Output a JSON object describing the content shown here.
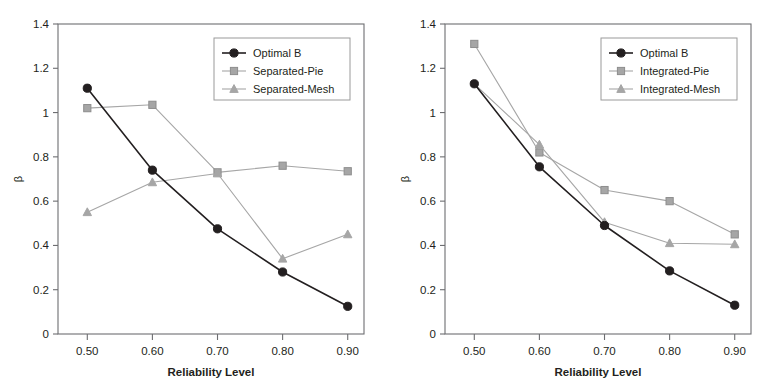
{
  "figure": {
    "background": "#ffffff",
    "panel_count": 2
  },
  "chart_data": [
    {
      "type": "line",
      "panel": "left",
      "title": "",
      "xlabel": "Reliability Level",
      "ylabel": "β",
      "x": [
        0.5,
        0.6,
        0.7,
        0.8,
        0.9
      ],
      "xticklabels": [
        "0.50",
        "0.60",
        "0.70",
        "0.80",
        "0.90"
      ],
      "yticklabels": [
        "0",
        "0.2",
        "0.4",
        "0.6",
        "0.8",
        "1",
        "1.2",
        "1.4"
      ],
      "yticks": [
        0,
        0.2,
        0.4,
        0.6,
        0.8,
        1.0,
        1.2,
        1.4
      ],
      "xlim": [
        0.455,
        0.925
      ],
      "ylim": [
        0,
        1.4
      ],
      "grid": false,
      "legend_position": "upper-right",
      "series": [
        {
          "name": "Optimal B",
          "values": [
            1.11,
            0.74,
            0.475,
            0.28,
            0.125
          ],
          "color": "#231f20",
          "marker": "circle",
          "linewidth": 1.6
        },
        {
          "name": "Separated-Pie",
          "values": [
            1.02,
            1.035,
            0.73,
            0.76,
            0.735
          ],
          "color": "#a6a6a6",
          "marker": "square",
          "linewidth": 1.1
        },
        {
          "name": "Separated-Mesh",
          "values": [
            0.55,
            0.685,
            0.725,
            0.34,
            0.45
          ],
          "color": "#a6a6a6",
          "marker": "triangle",
          "linewidth": 1.1
        }
      ]
    },
    {
      "type": "line",
      "panel": "right",
      "title": "",
      "xlabel": "Reliability Level",
      "ylabel": "β",
      "x": [
        0.5,
        0.6,
        0.7,
        0.8,
        0.9
      ],
      "xticklabels": [
        "0.50",
        "0.60",
        "0.70",
        "0.80",
        "0.90"
      ],
      "yticklabels": [
        "0",
        "0.2",
        "0.4",
        "0.6",
        "0.8",
        "1",
        "1.2",
        "1.4"
      ],
      "yticks": [
        0,
        0.2,
        0.4,
        0.6,
        0.8,
        1.0,
        1.2,
        1.4
      ],
      "xlim": [
        0.455,
        0.925
      ],
      "ylim": [
        0,
        1.4
      ],
      "grid": false,
      "legend_position": "upper-right",
      "series": [
        {
          "name": "Optimal B",
          "values": [
            1.13,
            0.755,
            0.49,
            0.285,
            0.13
          ],
          "color": "#231f20",
          "marker": "circle",
          "linewidth": 1.6
        },
        {
          "name": "Integrated-Pie",
          "values": [
            1.31,
            0.82,
            0.65,
            0.6,
            0.45
          ],
          "color": "#a6a6a6",
          "marker": "square",
          "linewidth": 1.1
        },
        {
          "name": "Integrated-Mesh",
          "values": [
            1.13,
            0.855,
            0.505,
            0.41,
            0.405
          ],
          "color": "#a6a6a6",
          "marker": "triangle",
          "linewidth": 1.1,
          "marker_start_index": 1
        }
      ]
    }
  ]
}
